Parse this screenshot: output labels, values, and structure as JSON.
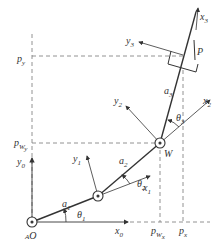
{
  "diagram": {
    "colors": {
      "line": "#333333",
      "dash": "#777777",
      "background": "#ffffff"
    },
    "joints": [
      {
        "id": "O",
        "x": 32,
        "y": 222
      },
      {
        "id": "J1",
        "x": 98,
        "y": 196
      },
      {
        "id": "W",
        "x": 160,
        "y": 143
      }
    ],
    "labels": {
      "origin": "O",
      "origin_prefix": "A",
      "wrist": "W",
      "point_p": "P",
      "a1": "a",
      "a1_sub": "1",
      "a2": "a",
      "a2_sub": "2",
      "a3": "a",
      "a3_sub": "3",
      "theta1": "θ",
      "theta1_sub": "1",
      "theta2": "θ",
      "theta2_sub": "2",
      "theta3": "θ",
      "theta3_sub": "3",
      "x0": "x",
      "x0_sub": "0",
      "y0": "y",
      "y0_sub": "0",
      "x1": "x",
      "x1_sub": "1",
      "y1": "y",
      "y1_sub": "1",
      "x2": "x",
      "x2_sub": "2",
      "y2": "y",
      "y2_sub": "2",
      "x3": "x",
      "x3_sub": "3",
      "y3": "y",
      "y3_sub": "3",
      "py": "p",
      "py_sub": "y",
      "pwy": "p",
      "pwy_sub": "W",
      "pwy_subsub": "y",
      "px": "p",
      "px_sub": "x",
      "pwx": "p",
      "pwx_sub": "W",
      "pwx_subsub": "x"
    }
  }
}
